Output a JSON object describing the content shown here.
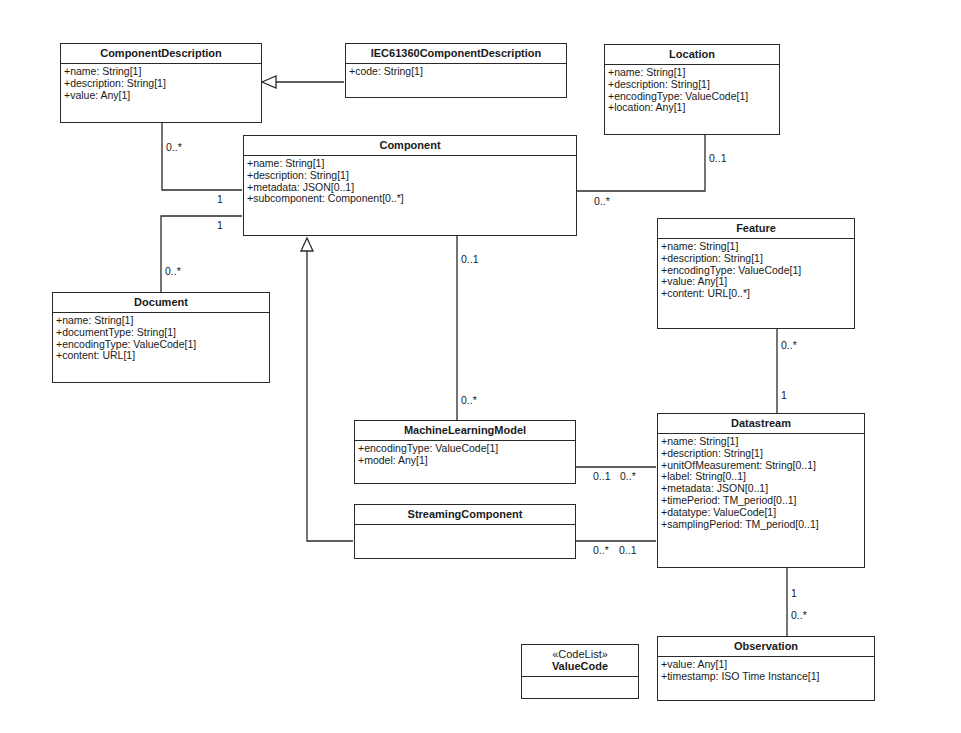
{
  "classes": {
    "component_description": {
      "name": "ComponentDescription",
      "attributes": [
        "+name: String[1]",
        "+description: String[1]",
        "+value: Any[1]"
      ]
    },
    "iec61360": {
      "name": "IEC61360ComponentDescription",
      "attributes": [
        "+code: String[1]"
      ]
    },
    "location": {
      "name": "Location",
      "attributes": [
        "+name: String[1]",
        "+description: String[1]",
        "+encodingType: ValueCode[1]",
        "+location: Any[1]"
      ]
    },
    "component": {
      "name": "Component",
      "attributes": [
        "+name: String[1]",
        "+description: String[1]",
        "+metadata: JSON[0..1]",
        "+subcomponent: Component[0..*]"
      ]
    },
    "feature": {
      "name": "Feature",
      "attributes": [
        "+name: String[1]",
        "+description: String[1]",
        "+encodingType: ValueCode[1]",
        "+value: Any[1]",
        "+content: URL[0..*]"
      ]
    },
    "document": {
      "name": "Document",
      "attributes": [
        "+name: String[1]",
        "+documentType: String[1]",
        "+encodingType: ValueCode[1]",
        "+content: URL[1]"
      ]
    },
    "ml_model": {
      "name": "MachineLearningModel",
      "attributes": [
        "+encodingType: ValueCode[1]",
        "+model: Any[1]"
      ]
    },
    "streaming": {
      "name": "StreamingComponent",
      "attributes": []
    },
    "datastream": {
      "name": "Datastream",
      "attributes": [
        "+name: String[1]",
        "+description: String[1]",
        "+unitOfMeasurement: String[0..1]",
        "+label: String[0..1]",
        "+metadata: JSON[0..1]",
        "+timePeriod: TM_period[0..1]",
        "+datatype: ValueCode[1]",
        "+samplingPeriod: TM_period[0..1]"
      ]
    },
    "observation": {
      "name": "Observation",
      "attributes": [
        "+value: Any[1]",
        "+timestamp: ISO Time Instance[1]"
      ]
    },
    "value_code": {
      "stereotype": "«CodeList»",
      "name": "ValueCode",
      "attributes": []
    }
  },
  "multiplicities": {
    "compdesc_end": "0..*",
    "compdesc_component_end": "1",
    "document_component_end": "1",
    "document_end": "0..*",
    "location_end": "0..1",
    "location_component_end": "0..*",
    "ml_component_end": "0..1",
    "ml_end": "0..*",
    "feature_end": "0..*",
    "feature_datastream_end": "1",
    "ml_datastream_ml_end": "0..1",
    "ml_datastream_ds_end": "0..*",
    "stream_datastream_sc_end": "0..*",
    "stream_datastream_ds_end": "0..1",
    "datastream_obs_ds_end": "1",
    "datastream_obs_obs_end": "0..*"
  }
}
